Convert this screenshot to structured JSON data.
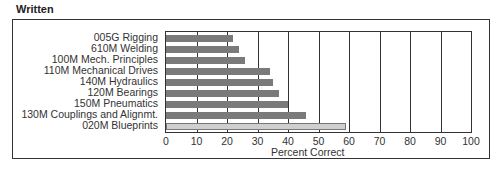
{
  "section_title": "Written",
  "chart_data": {
    "type": "bar",
    "orientation": "horizontal",
    "title": "Written",
    "xlabel": "Percent Correct",
    "ylabel": "",
    "xlim": [
      0,
      100
    ],
    "grid": true,
    "x_ticks": [
      "0",
      "10",
      "20",
      "30",
      "40",
      "50",
      "60",
      "70",
      "80",
      "90",
      "100"
    ],
    "categories": [
      "005G Rigging",
      "610M Welding",
      "100M Mech. Principles",
      "110M Mechanical Drives",
      "140M Hydraulics",
      "120M Bearings",
      "150M Pneumatics",
      "130M Couplings and Alignmt.",
      "020M Blueprints"
    ],
    "values": [
      22,
      24,
      26,
      34,
      35,
      37,
      40,
      46,
      59
    ],
    "colors": [
      "#7a7a7a",
      "#7a7a7a",
      "#7a7a7a",
      "#7a7a7a",
      "#7a7a7a",
      "#7a7a7a",
      "#7a7a7a",
      "#7a7a7a",
      "#cfcfcf"
    ],
    "legend": null
  }
}
